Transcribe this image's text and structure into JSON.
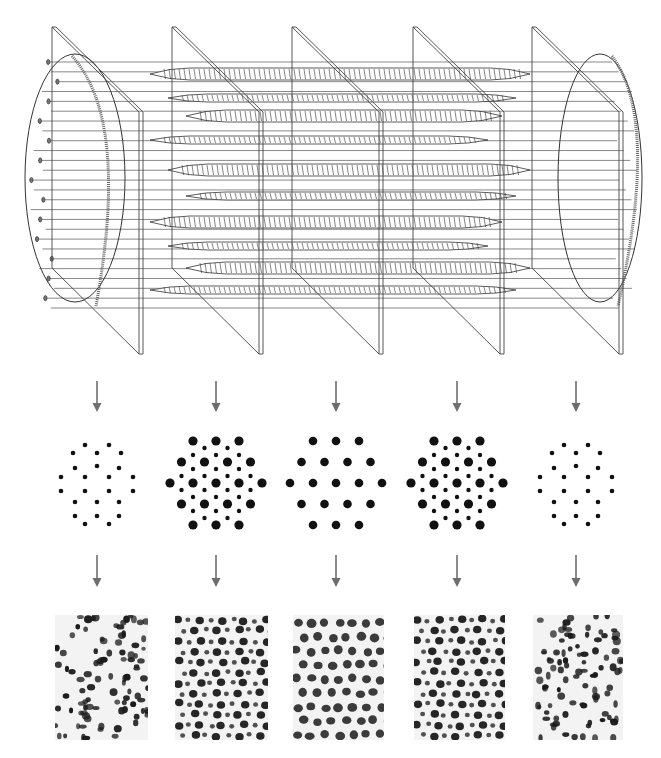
{
  "figure": {
    "colors": {
      "line": "#444444",
      "arrow": "#6e6e6e",
      "dot": "#111111",
      "micrograph_bg": "#f3f3f3"
    }
  },
  "sections": [
    {
      "id": 1,
      "region": "end (thin filaments only)",
      "lattice": "thin-only",
      "micrograph": "sparse-irregular"
    },
    {
      "id": 2,
      "region": "overlap (thick + thin)",
      "lattice": "thick-and-thin",
      "micrograph": "dense-mixed"
    },
    {
      "id": 3,
      "region": "center (thick filaments only)",
      "lattice": "thick-only",
      "micrograph": "regular-thick"
    },
    {
      "id": 4,
      "region": "overlap (thick + thin)",
      "lattice": "thick-and-thin",
      "micrograph": "dense-mixed"
    },
    {
      "id": 5,
      "region": "end (thin filaments only)",
      "lattice": "thin-only",
      "micrograph": "sparse-irregular"
    }
  ],
  "icons": {
    "arrow": "down-arrow-icon"
  }
}
